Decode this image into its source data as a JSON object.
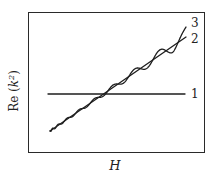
{
  "chart_data": {
    "type": "line",
    "title": "",
    "xlabel": "H",
    "ylabel": "Re (k²)",
    "ylabel_main": "Re (k",
    "ylabel_sup": "2",
    "ylabel_end": ")",
    "grid": false,
    "legend": "inline curve labels at right end",
    "axis_ticks": "none",
    "xlim": [
      0,
      1
    ],
    "ylim": [
      0,
      1
    ],
    "series": [
      {
        "name": "1",
        "description": "horizontal constant line",
        "x": [
          0.14,
          0.89
        ],
        "y": [
          0.41,
          0.41
        ]
      },
      {
        "name": "2",
        "description": "straight increasing line",
        "x": [
          0.12,
          0.89
        ],
        "y": [
          0.15,
          0.82
        ]
      },
      {
        "name": "3",
        "description": "oscillating curve around line 2 with growing amplitude and decreasing frequency",
        "x": [
          0.12,
          0.89
        ],
        "y_start": 0.15,
        "y_end": 0.89
      }
    ]
  },
  "labels": {
    "curve1": "1",
    "curve2": "2",
    "curve3": "3",
    "xaxis": "H"
  }
}
